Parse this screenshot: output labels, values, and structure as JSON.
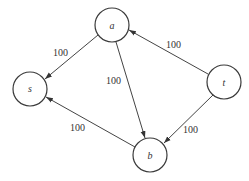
{
  "diagram": {
    "type": "directed-graph",
    "nodes": [
      {
        "id": "a",
        "label": "a",
        "cx": 112,
        "cy": 25
      },
      {
        "id": "s",
        "label": "s",
        "cx": 30,
        "cy": 89
      },
      {
        "id": "t",
        "label": "t",
        "cx": 224,
        "cy": 82
      },
      {
        "id": "b",
        "label": "b",
        "cx": 150,
        "cy": 155
      }
    ],
    "edges": [
      {
        "from": "a",
        "to": "s",
        "label": "100"
      },
      {
        "from": "a",
        "to": "b",
        "label": "100"
      },
      {
        "from": "t",
        "to": "a",
        "label": "100"
      },
      {
        "from": "t",
        "to": "b",
        "label": "100"
      },
      {
        "from": "b",
        "to": "s",
        "label": "100"
      }
    ],
    "node_radius": 17
  }
}
